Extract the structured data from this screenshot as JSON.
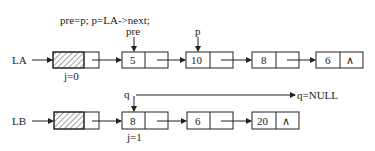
{
  "code": "pre=p; p=LA->next;",
  "list_a": {
    "label": "LA",
    "head_index_label": "j=0",
    "nodes": [
      "5",
      "10",
      "8",
      "6"
    ],
    "null_symbol": "∧",
    "pointers": [
      {
        "name": "pre",
        "node": "5"
      },
      {
        "name": "p",
        "node": "10"
      }
    ]
  },
  "list_b": {
    "label": "LB",
    "index_label": "j=1",
    "nodes": [
      "8",
      "6",
      "20"
    ],
    "null_symbol": "∧",
    "pointers": [
      {
        "name": "q",
        "node": "8"
      }
    ],
    "q_null_label": "q=NULL"
  }
}
